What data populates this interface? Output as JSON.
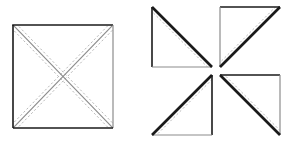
{
  "figure": {
    "title": "Square with diagonal stitching lines and resulting pinwheel of four half-square triangles",
    "background_color": "#ffffff",
    "canvas": {
      "width": 290,
      "height": 158
    },
    "colors": {
      "solid_edge": "#1a1a1a",
      "light_edge": "#8c8c8c",
      "dashed_line": "#b0b0b0",
      "fill": "#ffffff"
    },
    "stroke_widths": {
      "outline": 1.6,
      "thick_bias_edge": 2.6,
      "light_edge": 1.2,
      "dashed": 0.9
    },
    "dash_pattern": "2.2 2.2"
  },
  "panels": [
    {
      "id": "panel-left",
      "name": "marked-square",
      "label": "Square marked with two diagonals, each flanked by a pair of dashed sewing lines",
      "shape": "square",
      "origin": {
        "x": 13,
        "y": 25
      },
      "size": {
        "width": 100,
        "height": 103
      },
      "diagonals": [
        {
          "name": "diagonal-tl-br",
          "from": "top-left",
          "to": "bottom-right"
        },
        {
          "name": "diagonal-bl-tr",
          "from": "bottom-left",
          "to": "top-right"
        }
      ],
      "dashed_offsets_px": [
        -3.2,
        3.2
      ],
      "dashed_lines_per_diagonal": 2,
      "total_dashed_lines": 4
    },
    {
      "id": "panel-right",
      "name": "pinwheel-of-four-triangles",
      "label": "Four half-square triangles separated by a cross-shaped gap, rotated into a pinwheel",
      "origin": {
        "x": 152,
        "y": 7
      },
      "size": {
        "width": 128,
        "height": 128
      },
      "gap_px": 8,
      "triangles": [
        {
          "id": "triangle-top-left",
          "name": "triangle-top-left",
          "right_angle_corner": "bottom-left",
          "hypotenuse": "top-left-to-bottom-right",
          "thick_edge": "hypotenuse",
          "dashed_offsets_px": [
            -3.2,
            3.2
          ]
        },
        {
          "id": "triangle-top-right",
          "name": "triangle-top-right",
          "right_angle_corner": "top-left",
          "hypotenuse": "bottom-left-to-top-right",
          "thick_edge": "hypotenuse",
          "dashed_offsets_px": [
            -3.2,
            3.2
          ]
        },
        {
          "id": "triangle-bottom-left",
          "name": "triangle-bottom-left",
          "right_angle_corner": "bottom-right",
          "hypotenuse": "bottom-left-to-top-right",
          "thick_edge": "hypotenuse",
          "dashed_offsets_px": [
            -3.2,
            3.2
          ]
        },
        {
          "id": "triangle-bottom-right",
          "name": "triangle-bottom-right",
          "right_angle_corner": "top-right",
          "hypotenuse": "top-left-to-bottom-right",
          "thick_edge": "hypotenuse",
          "dashed_offsets_px": [
            -3.2,
            3.2
          ]
        }
      ]
    }
  ]
}
